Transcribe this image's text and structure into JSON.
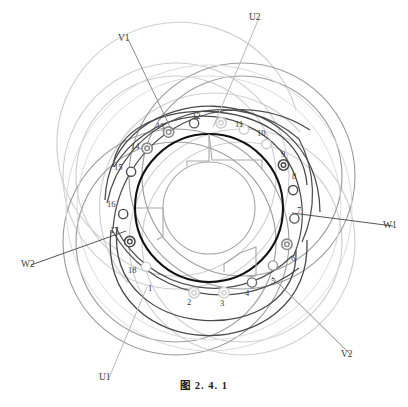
{
  "figure": {
    "caption": "图   2. 4. 1",
    "geometry": {
      "center_x": 209,
      "center_y": 208,
      "bore_outer_radius": 74,
      "bore_inner_radius": 46,
      "slot_marker_radius": 86
    }
  },
  "terminals": [
    {
      "name": "U1",
      "label": "U1",
      "x": 99,
      "y": 373,
      "lead_to_x": 147,
      "lead_to_y": 287,
      "color": "#b9b9b9"
    },
    {
      "name": "U2",
      "label": "U2",
      "x": 249,
      "y": 13,
      "lead_to_x": 213,
      "lead_to_y": 127,
      "color": "#b9b9b9"
    },
    {
      "name": "V1",
      "label": "V1",
      "x": 118,
      "y": 34,
      "lead_to_x": 172,
      "lead_to_y": 131,
      "color": "#8d8d8d"
    },
    {
      "name": "V2",
      "label": "V2",
      "x": 341,
      "y": 350,
      "lead_to_x": 272,
      "lead_to_y": 277,
      "color": "#8d8d8d"
    },
    {
      "name": "W1",
      "label": "W1",
      "x": 383,
      "y": 221,
      "lead_to_x": 292,
      "lead_to_y": 213,
      "color": "#555555"
    },
    {
      "name": "W2",
      "label": "W2",
      "x": 21,
      "y": 260,
      "lead_to_x": 126,
      "lead_to_y": 231,
      "color": "#555555"
    }
  ],
  "slots": [
    {
      "num": "1",
      "angle_deg": 100,
      "marker": "ring-light",
      "label_x": 148,
      "label_y": 284,
      "color": "#cfcfcf"
    },
    {
      "num": "2",
      "angle_deg": 80,
      "marker": "ring-light",
      "label_x": 187,
      "label_y": 298,
      "color": "#d6d6d6"
    },
    {
      "num": "3",
      "angle_deg": 60,
      "marker": "circle-dark",
      "label_x": 220,
      "label_y": 299,
      "color": "#6e6e6e"
    },
    {
      "num": "4",
      "angle_deg": 42,
      "marker": "circle-mid",
      "label_x": 245,
      "label_y": 289,
      "color": "#9a9a9a"
    },
    {
      "num": "5",
      "angle_deg": 25,
      "marker": "ring-mid",
      "label_x": 271,
      "label_y": 277,
      "color": "#8a8a8a"
    },
    {
      "num": "6",
      "angle_deg": 7,
      "marker": "circle-dark",
      "label_x": 291,
      "label_y": 254,
      "color": "#5a5a5a"
    },
    {
      "num": "7",
      "angle_deg": -12,
      "marker": "circle-dark",
      "label_x": 297,
      "label_y": 206,
      "color": "#4a4a4a"
    },
    {
      "num": "8",
      "angle_deg": -30,
      "marker": "ring-dark",
      "label_x": 292,
      "label_y": 172,
      "color": "#4a4a4a"
    },
    {
      "num": "9",
      "angle_deg": -48,
      "marker": "circle-light",
      "label_x": 281,
      "label_y": 150,
      "color": "#c6c6c6"
    },
    {
      "num": "10",
      "angle_deg": -66,
      "marker": "circle-light",
      "label_x": 257,
      "label_y": 129,
      "color": "#cbcbcb"
    },
    {
      "num": "11",
      "angle_deg": -82,
      "marker": "ring-light",
      "label_x": 235,
      "label_y": 120,
      "color": "#cecece"
    },
    {
      "num": "12",
      "angle_deg": -100,
      "marker": "circle-dark",
      "label_x": 192,
      "label_y": 112,
      "color": "#5a5a5a"
    },
    {
      "num": "13",
      "angle_deg": -118,
      "marker": "ring-mid",
      "label_x": 156,
      "label_y": 122,
      "color": "#8a8a8a"
    },
    {
      "num": "14",
      "angle_deg": -136,
      "marker": "ring-mid",
      "label_x": 131,
      "label_y": 142,
      "color": "#8a8a8a"
    },
    {
      "num": "15",
      "angle_deg": -155,
      "marker": "circle-dark",
      "label_x": 114,
      "label_y": 163,
      "color": "#4a4a4a"
    },
    {
      "num": "16",
      "angle_deg": 176,
      "marker": "circle-dark",
      "label_x": 107,
      "label_y": 200,
      "color": "#4a4a4a"
    },
    {
      "num": "17",
      "angle_deg": 157,
      "marker": "ring-dark",
      "label_x": 110,
      "label_y": 226,
      "color": "#4a4a4a"
    },
    {
      "num": "18",
      "angle_deg": 137,
      "marker": "circle-light",
      "label_x": 128,
      "label_y": 266,
      "color": "#cacaca"
    }
  ],
  "colors": {
    "phase_u": "#b9b9b9",
    "phase_v": "#8d8d8d",
    "phase_w": "#4a4a4a",
    "bore_outline": "#111111",
    "bore_inner": "#a8a8a8",
    "page_bg": "#ffffff"
  },
  "coil_arcs": [
    {
      "phase": "W",
      "color": "#4a4a4a",
      "from_slot": 15,
      "to_slot": 6,
      "rx": 97,
      "ry": 97,
      "note": "W phase outer overhang"
    },
    {
      "phase": "W",
      "color": "#4a4a4a",
      "from_slot": 16,
      "to_slot": 7,
      "rx": 110,
      "ry": 110,
      "note": "W phase outer overhang"
    },
    {
      "phase": "W",
      "color": "#4a4a4a",
      "from_slot": 17,
      "to_slot": 8,
      "rx": 122,
      "ry": 122,
      "note": "W phase outer overhang"
    },
    {
      "phase": "V",
      "color": "#8d8d8d",
      "from_slot": 13,
      "to_slot": 4,
      "rx": 97,
      "ry": 97,
      "note": "V phase outer overhang"
    },
    {
      "phase": "V",
      "color": "#8d8d8d",
      "from_slot": 14,
      "to_slot": 5,
      "rx": 110,
      "ry": 110,
      "note": "V phase outer overhang"
    },
    {
      "phase": "U",
      "color": "#c9c9c9",
      "from_slot": 11,
      "to_slot": 2,
      "rx": 97,
      "ry": 97,
      "note": "U phase outer overhang"
    },
    {
      "phase": "U",
      "color": "#c9c9c9",
      "from_slot": 12,
      "to_slot": 3,
      "rx": 110,
      "ry": 110,
      "note": "U phase outer overhang"
    },
    {
      "phase": "U",
      "color": "#c9c9c9",
      "from_slot": 10,
      "to_slot": 1,
      "rx": 122,
      "ry": 122,
      "note": "U phase outer overhang"
    }
  ]
}
